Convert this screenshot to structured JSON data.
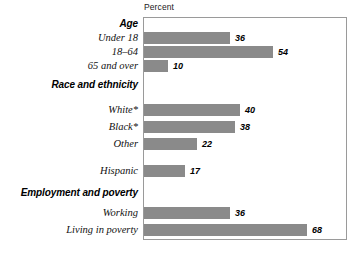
{
  "chart_data": {
    "type": "bar",
    "title": "",
    "xlabel": "Percent",
    "ylabel": "",
    "orientation": "horizontal",
    "xlim": [
      0,
      85
    ],
    "grid": false,
    "legend": null,
    "groups": [
      {
        "heading": "Age",
        "categories": [
          "Under 18",
          "18–64",
          "65 and over"
        ],
        "values": [
          36,
          54,
          10
        ]
      },
      {
        "heading": "Race and ethnicity",
        "categories": [
          "White*",
          "Black*",
          "Other",
          "Hispanic"
        ],
        "values": [
          40,
          38,
          22,
          17
        ]
      },
      {
        "heading": "Employment and poverty",
        "categories": [
          "Working",
          "Living in poverty"
        ],
        "values": [
          36,
          68
        ]
      }
    ],
    "categories": [
      "Under 18",
      "18–64",
      "65 and over",
      "White*",
      "Black*",
      "Other",
      "Hispanic",
      "Working",
      "Living in poverty"
    ],
    "values": [
      36,
      54,
      10,
      40,
      38,
      22,
      17,
      36,
      68
    ],
    "bar_color": "#8a8a8a",
    "frame_color": "#9a9a9a"
  },
  "rows": [
    {
      "kind": "heading",
      "label": "Age",
      "top": 17,
      "value": null,
      "bar_px": 0
    },
    {
      "kind": "bar",
      "label": "Under 18",
      "top": 31,
      "value": "36",
      "bar_px": 86
    },
    {
      "kind": "bar",
      "label": "18–64",
      "top": 45,
      "value": "54",
      "bar_px": 129
    },
    {
      "kind": "bar",
      "label": "65 and over",
      "top": 59,
      "value": "10",
      "bar_px": 24
    },
    {
      "kind": "heading",
      "label": "Race and ethnicity",
      "top": 78,
      "value": null,
      "bar_px": 0
    },
    {
      "kind": "bar",
      "label": "White*",
      "top": 103,
      "value": "40",
      "bar_px": 96
    },
    {
      "kind": "bar",
      "label": "Black*",
      "top": 120,
      "value": "38",
      "bar_px": 91
    },
    {
      "kind": "bar",
      "label": "Other",
      "top": 137,
      "value": "22",
      "bar_px": 53
    },
    {
      "kind": "bar",
      "label": "Hispanic",
      "top": 164,
      "value": "17",
      "bar_px": 41
    },
    {
      "kind": "heading",
      "label": "Employment and poverty",
      "top": 186,
      "value": null,
      "bar_px": 0
    },
    {
      "kind": "bar",
      "label": "Working",
      "top": 206,
      "value": "36",
      "bar_px": 86
    },
    {
      "kind": "bar",
      "label": "Living in poverty",
      "top": 223,
      "value": "68",
      "bar_px": 163
    }
  ]
}
